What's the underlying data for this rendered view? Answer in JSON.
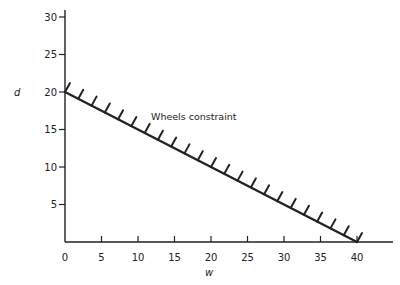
{
  "chart_data": {
    "type": "line",
    "title": "",
    "xlabel": "w",
    "ylabel": "d",
    "xlim": [
      0,
      45
    ],
    "ylim": [
      0,
      32
    ],
    "grid": false,
    "legend": null,
    "x_ticks": [
      0,
      5,
      10,
      15,
      20,
      25,
      30,
      35,
      40
    ],
    "y_ticks": [
      5,
      10,
      15,
      20,
      25,
      30
    ],
    "series": [
      {
        "name": "Wheels constraint",
        "style": "hatched constraint line (hatches on upper side)",
        "x": [
          0,
          40
        ],
        "y": [
          20,
          0
        ]
      }
    ],
    "annotations": [
      {
        "text": "Wheels constraint",
        "x": 12,
        "y": 17
      }
    ]
  },
  "colors": {
    "ink": "#222222",
    "background": "#ffffff"
  }
}
